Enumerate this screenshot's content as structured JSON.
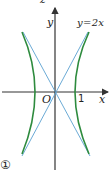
{
  "figure": {
    "panel_marker": "①",
    "top_clipped_label": "z",
    "axes": {
      "x_label": "x",
      "y_label": "y",
      "origin_label": "O",
      "tick_x": "1"
    },
    "asymptote_label": "y=2x",
    "colors": {
      "hyperbola": "#2e8b3e",
      "asymptote": "#5aa0d0",
      "axis": "#333333"
    }
  }
}
